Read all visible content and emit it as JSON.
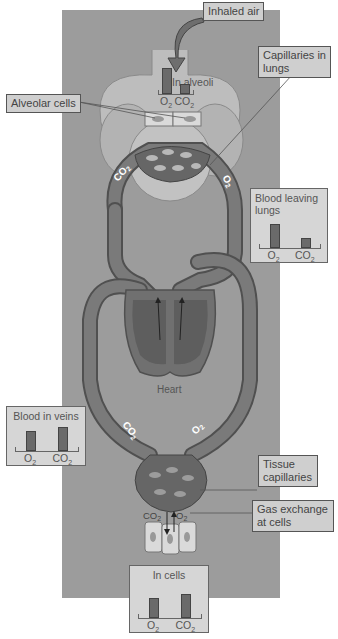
{
  "labels": {
    "inhaled_air": "Inhaled air",
    "capillaries_in_lungs": "Capillaries in lungs",
    "alveolar_cells": "Alveolar cells",
    "tissue_capillaries": "Tissue capillaries",
    "gas_exchange_at_cells": "Gas exchange at cells",
    "heart": "Heart"
  },
  "flow_labels": {
    "lung_left": "CO2",
    "lung_right": "O2",
    "tissue_left": "CO2",
    "tissue_right": "O2",
    "cells_left": "CO2",
    "cells_right": "O2"
  },
  "gas_charts": [
    {
      "id": "in_alveoli",
      "title": "In alveoli",
      "categories": [
        "O2",
        "CO2"
      ],
      "relative_levels": [
        1.0,
        0.4
      ]
    },
    {
      "id": "blood_leaving_lungs",
      "title": "Blood leaving lungs",
      "categories": [
        "O2",
        "CO2"
      ],
      "relative_levels": [
        1.0,
        0.4
      ]
    },
    {
      "id": "blood_in_veins",
      "title": "Blood in veins",
      "categories": [
        "O2",
        "CO2"
      ],
      "relative_levels": [
        0.85,
        1.0
      ]
    },
    {
      "id": "in_cells",
      "title": "In cells",
      "categories": [
        "O2",
        "CO2"
      ],
      "relative_levels": [
        0.85,
        1.0
      ]
    }
  ],
  "colors": {
    "panel": "#9c9c9c",
    "vessel": "#6e6e6e",
    "vessel_edge": "#505050",
    "lung": "#b8b8b8",
    "bar": "#6a6a6a",
    "label_bg": "#cfcfcf"
  }
}
